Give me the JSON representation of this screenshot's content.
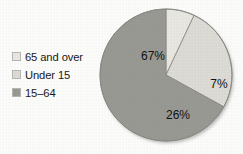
{
  "chart_data": {
    "type": "pie",
    "title": "",
    "subtitle": "",
    "xlabel": "",
    "ylabel": "",
    "grid": false,
    "legend_position": "left",
    "categories": [
      "65 and over",
      "Under 15",
      "15–64"
    ],
    "values": [
      7,
      26,
      67
    ],
    "value_unit": "%",
    "data_labels": [
      "7%",
      "26%",
      "67%"
    ],
    "colors": [
      "#e9e8e3",
      "#dedcd6",
      "#9a9a95"
    ],
    "slices": [
      {
        "label": "65 and over",
        "value": 7,
        "data_label": "7%",
        "color": "#e9e8e3"
      },
      {
        "label": "Under 15",
        "value": 26,
        "data_label": "26%",
        "color": "#dedcd6"
      },
      {
        "label": "15–64",
        "value": 67,
        "data_label": "67%",
        "color": "#9a9a95"
      }
    ]
  },
  "legend": {
    "items": [
      {
        "label": "65 and over",
        "color": "#e9e8e3"
      },
      {
        "label": "Under 15",
        "color": "#dedcd6"
      },
      {
        "label": "15–64",
        "color": "#9a9a95"
      }
    ]
  },
  "pie": {
    "labels": {
      "large": "67%",
      "medium": "26%",
      "small": "7%"
    }
  }
}
